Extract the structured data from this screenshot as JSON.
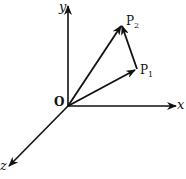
{
  "diagram": {
    "title": "",
    "axes": {
      "x": "x",
      "y": "y",
      "z": "z"
    },
    "origin_label": "O",
    "points": [
      {
        "name": "P",
        "sub": "1"
      },
      {
        "name": "P",
        "sub": "2"
      }
    ],
    "vectors": [
      "O→P1",
      "O→P2",
      "P1→P2"
    ],
    "color": "#111111"
  }
}
